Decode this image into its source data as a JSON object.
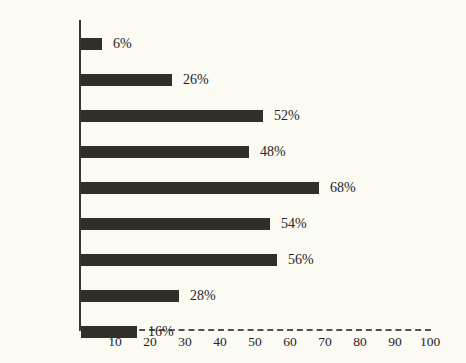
{
  "chart_data": {
    "type": "bar",
    "orientation": "horizontal",
    "title": "",
    "xlabel": "",
    "ylabel": "",
    "xlim": [
      0,
      100
    ],
    "xticks": [
      10,
      20,
      30,
      40,
      50,
      60,
      70,
      80,
      90,
      100
    ],
    "grid": false,
    "legend": null,
    "value_suffix": "%",
    "categories": [
      "valence",
      "voice",
      "aspect",
      "tense",
      "mood",
      "number",
      "person",
      "person\n(object)",
      "gender"
    ],
    "values": [
      6,
      26,
      52,
      48,
      68,
      54,
      56,
      28,
      16
    ],
    "data_labels": [
      "6%",
      "26%",
      "52%",
      "48%",
      "68%",
      "54%",
      "56%",
      "28%",
      "16%"
    ],
    "colors": {
      "bar": "#332e27",
      "background": "#fbfaf3",
      "axis": "#3a352e",
      "text": "#26231f"
    }
  }
}
